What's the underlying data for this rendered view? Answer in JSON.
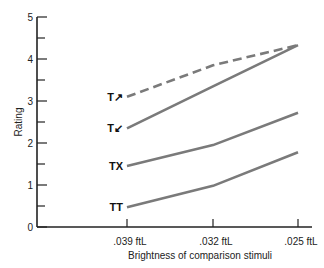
{
  "chart_data": {
    "type": "line",
    "title": "",
    "xlabel": "Brightness of comparison stimuli",
    "ylabel": "Rating",
    "categories": [
      ".039 ftL",
      ".032 ftL",
      ".025 ftL"
    ],
    "ylim": [
      0,
      5
    ],
    "yticks": [
      0,
      1,
      2,
      3,
      4,
      5
    ],
    "grid": false,
    "legend": "inline labels at left of each line",
    "series": [
      {
        "name": "T↗",
        "style": "dashed",
        "values": [
          3.1,
          3.85,
          4.33
        ]
      },
      {
        "name": "T↙",
        "style": "solid",
        "values": [
          2.35,
          3.35,
          4.33
        ]
      },
      {
        "name": "TX",
        "style": "solid",
        "values": [
          1.45,
          1.95,
          2.72
        ]
      },
      {
        "name": "TT",
        "style": "solid",
        "values": [
          0.47,
          0.98,
          1.78
        ]
      }
    ],
    "line_color": "#7a7a7a"
  }
}
